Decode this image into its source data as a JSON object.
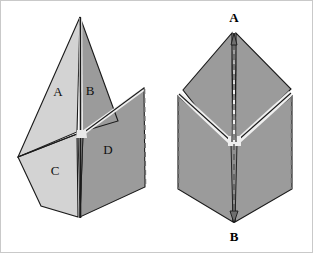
{
  "figure": {
    "background_color": "#ffffff",
    "border_color": "#c9c9c9",
    "colors": {
      "panel_light": "#d3d3d3",
      "panel_mid": "#b9b9b9",
      "panel_dark": "#9b9b9b",
      "panel_darker": "#8f8f8f",
      "outline": "#1a1a1a",
      "fold_highlight": "#efefef",
      "dashed_edge": "#6f6f6f",
      "label_color": "#111111"
    },
    "left_figure": {
      "name": "unfolded-sheet-labeled",
      "panel_labels": [
        {
          "id": "A",
          "text": "A",
          "x": 57,
          "y": 92,
          "fill": "#d3d3d3"
        },
        {
          "id": "B",
          "text": "B",
          "x": 89,
          "y": 91,
          "fill": "#9b9b9b"
        },
        {
          "id": "C",
          "text": "C",
          "x": 54,
          "y": 171,
          "fill": "#d3d3d3"
        },
        {
          "id": "D",
          "text": "D",
          "x": 107,
          "y": 150,
          "fill": "#9b9b9b"
        }
      ],
      "vertices": {
        "top_apex": {
          "x": 79,
          "y": 16
        },
        "center": {
          "x": 80,
          "y": 133
        },
        "bottom": {
          "x": 78,
          "y": 218
        },
        "left": {
          "x": 17,
          "y": 156
        },
        "right_top": {
          "x": 143,
          "y": 87
        },
        "right_bottom": {
          "x": 144,
          "y": 186
        }
      }
    },
    "right_figure": {
      "name": "folded-sheet-with-axis",
      "vertex_labels": [
        {
          "id": "A",
          "text": "A",
          "x": 233,
          "y": 18
        },
        {
          "id": "B",
          "text": "B",
          "x": 233,
          "y": 237
        }
      ],
      "vertices": {
        "top_apex": {
          "x": 233,
          "y": 32
        },
        "center": {
          "x": 233,
          "y": 142
        },
        "bottom": {
          "x": 233,
          "y": 222
        },
        "left_wing_top": {
          "x": 182,
          "y": 89
        },
        "right_wing_top": {
          "x": 290,
          "y": 88
        },
        "left_wing_bottom": {
          "x": 177,
          "y": 188
        },
        "right_wing_bottom": {
          "x": 291,
          "y": 188
        }
      },
      "axis_line_style": "dashed"
    }
  }
}
